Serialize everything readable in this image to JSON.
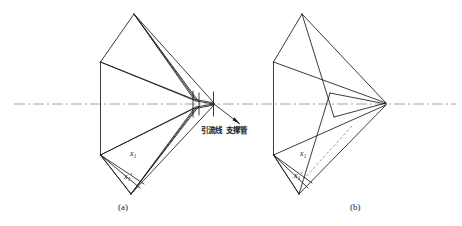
{
  "figure": {
    "title": "",
    "background_color": "#ffffff",
    "line_color": "#1a1a1a",
    "centerline_color": "#9a9a9a",
    "annotations": {
      "lead_wire": "引流线",
      "support_tube": "支撑管"
    },
    "panels": [
      {
        "id": "a",
        "caption": "(a)",
        "dimension_labels": [
          {
            "key": "x1",
            "text": "x",
            "subscript": "1"
          },
          {
            "key": "x1prime",
            "text": "x",
            "subscript": "1",
            "prime": "′"
          }
        ]
      },
      {
        "id": "b",
        "caption": "(b)",
        "dimension_labels": [
          {
            "key": "x1",
            "text": "x",
            "subscript": "1"
          },
          {
            "key": "x1prime",
            "text": "x",
            "subscript": "1",
            "prime": "′"
          }
        ]
      }
    ],
    "dimension_text": {
      "x1": "x₁",
      "x1_prime": "x₁′"
    }
  }
}
